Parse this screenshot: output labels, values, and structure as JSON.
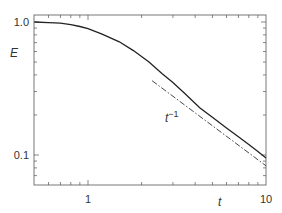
{
  "chart_data": {
    "type": "line",
    "title": "",
    "xlabel": "t",
    "ylabel": "E",
    "xscale": "log",
    "yscale": "log",
    "xlim": [
      0.5,
      10
    ],
    "ylim": [
      0.06,
      1.13
    ],
    "grid": false,
    "legend": null,
    "x_ticks": [
      {
        "value": 1,
        "label": "1"
      },
      {
        "value": 10,
        "label": "10"
      }
    ],
    "y_ticks": [
      {
        "value": 1.0,
        "label": "1.0"
      },
      {
        "value": 0.1,
        "label": "0.1"
      }
    ],
    "series": [
      {
        "name": "E(t)",
        "style": "solid",
        "color": "#222222",
        "x": [
          0.5,
          0.6,
          0.7,
          0.8,
          0.9,
          1.0,
          1.2,
          1.5,
          1.8,
          2.2,
          2.6,
          3.0,
          3.5,
          4.26,
          5.0,
          6.0,
          7.0,
          8.0,
          9.0,
          10.0
        ],
        "y": [
          1.0,
          0.99,
          0.98,
          0.955,
          0.925,
          0.89,
          0.81,
          0.71,
          0.61,
          0.5,
          0.41,
          0.35,
          0.29,
          0.226,
          0.192,
          0.16,
          0.137,
          0.12,
          0.106,
          0.095
        ]
      },
      {
        "name": "t^-1 asymptote",
        "style": "dash-dot",
        "color": "#333333",
        "x": [
          2.29,
          10.0
        ],
        "y": [
          0.362,
          0.083
        ]
      }
    ],
    "annotations": [
      {
        "text": "t",
        "superscript": "−1",
        "x": 3.0,
        "y": 0.185
      }
    ]
  },
  "labels": {
    "ylabel": "E",
    "xlabel": "t",
    "x_tick_1": "1",
    "x_tick_10": "10",
    "y_tick_1": "1.0",
    "y_tick_01": "0.1",
    "annotation_base": "t",
    "annotation_sup": "−1"
  }
}
